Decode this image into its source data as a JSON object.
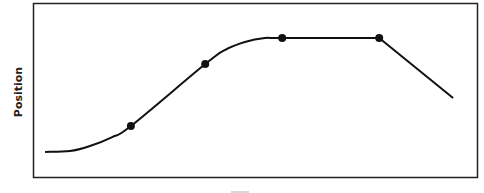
{
  "chart_data": {
    "type": "line",
    "title": "",
    "xlabel": "Time",
    "ylabel": "Position",
    "xlim": [
      0,
      100
    ],
    "ylim": [
      0,
      100
    ],
    "grid": false,
    "legend": "none",
    "ticks": false,
    "series": [
      {
        "name": "position-vs-time",
        "color": "#111111",
        "x": [
          2.7,
          8.3,
          12.8,
          17.8,
          22.0,
          38.7,
          43.1,
          47.6,
          52.1,
          56.0,
          77.8,
          94.4
        ],
        "y": [
          14.9,
          15.4,
          18.3,
          23.4,
          29.7,
          65.1,
          73.1,
          77.7,
          80.0,
          80.0,
          80.0,
          45.7
        ]
      }
    ],
    "markers": [
      {
        "x": 22.0,
        "y": 29.7
      },
      {
        "x": 38.7,
        "y": 65.1
      },
      {
        "x": 56.0,
        "y": 80.0
      },
      {
        "x": 77.8,
        "y": 80.0
      }
    ]
  }
}
